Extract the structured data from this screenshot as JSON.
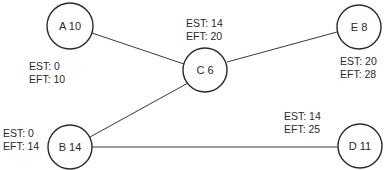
{
  "diagram": {
    "type": "activity-on-node network",
    "nodes": [
      {
        "id": "A",
        "label": "A 10",
        "duration": 10,
        "est": "EST: 0",
        "eft": "EFT: 10"
      },
      {
        "id": "B",
        "label": "B 14",
        "duration": 14,
        "est": "EST: 0",
        "eft": "EFT: 14"
      },
      {
        "id": "C",
        "label": "C 6",
        "duration": 6,
        "est": "EST: 14",
        "eft": "EFT: 20"
      },
      {
        "id": "D",
        "label": "D 11",
        "duration": 11,
        "est": "EST: 14",
        "eft": "EFT: 25"
      },
      {
        "id": "E",
        "label": "E 8",
        "duration": 8,
        "est": "EST: 20",
        "eft": "EFT: 28"
      }
    ],
    "edges": [
      {
        "from": "A",
        "to": "C"
      },
      {
        "from": "B",
        "to": "C"
      },
      {
        "from": "C",
        "to": "E"
      },
      {
        "from": "B",
        "to": "D"
      }
    ]
  }
}
